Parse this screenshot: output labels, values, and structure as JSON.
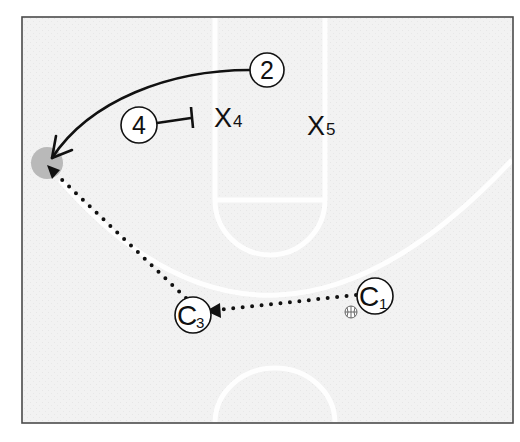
{
  "diagram": {
    "type": "basketball-play",
    "colors": {
      "court_bg": "#f1f1f1",
      "court_lines": "#ffffff",
      "frame": "#4a4a4a",
      "ink": "#111111",
      "target_spot": "#b9b9b9"
    },
    "frame": {
      "x": 22,
      "y": 17,
      "width": 491,
      "height": 406
    },
    "players": {
      "offense": [
        {
          "id": "2",
          "label": "2",
          "cx": 267,
          "cy": 70,
          "r": 17
        },
        {
          "id": "4",
          "label": "4",
          "cx": 139,
          "cy": 125,
          "r": 18
        }
      ],
      "coaches": [
        {
          "id": "C1",
          "letter": "C",
          "sub": "1",
          "cx": 375,
          "cy": 296,
          "r": 18,
          "has_ball": true
        },
        {
          "id": "C3",
          "letter": "C",
          "sub": "3",
          "cx": 193,
          "cy": 315,
          "r": 18,
          "has_ball": false
        }
      ],
      "defense": [
        {
          "id": "X4",
          "letter": "X",
          "sub": "4",
          "x": 214,
          "y": 127
        },
        {
          "id": "X5",
          "letter": "X",
          "sub": "5",
          "x": 307,
          "y": 135
        }
      ]
    },
    "actions": [
      {
        "type": "cut",
        "from": "2",
        "to": "target-spot",
        "style": "solid-arrow"
      },
      {
        "type": "screen",
        "from": "4",
        "on": "X4",
        "style": "solid-t-bar"
      },
      {
        "type": "pass",
        "from": "C1",
        "to": "C3",
        "style": "dotted-arrow"
      },
      {
        "type": "pass",
        "from": "C3",
        "to": "target-spot",
        "style": "dotted-arrow"
      }
    ],
    "target_spot": {
      "cx": 47,
      "cy": 163,
      "r": 16
    },
    "ball": {
      "cx": 351,
      "cy": 312,
      "r": 6
    }
  }
}
